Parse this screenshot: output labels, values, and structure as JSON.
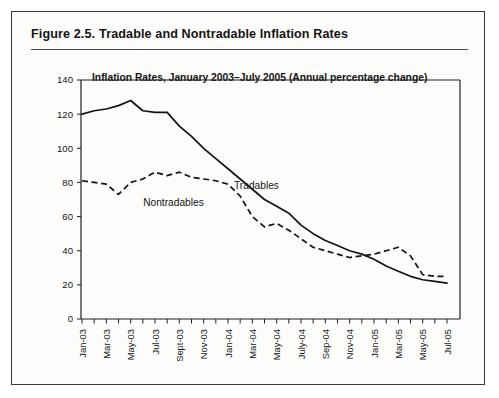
{
  "figure": {
    "number": "Figure 2.5.",
    "caption": "Tradable and Nontradable Inflation Rates"
  },
  "chart_data": {
    "type": "line",
    "title": "Inflation Rates, January 2003–July 2005 (Annual percentage change)",
    "xlabel": "",
    "ylabel": "",
    "ylim": [
      0,
      140
    ],
    "ytick_labels": [
      "0",
      "20",
      "40",
      "60",
      "80",
      "100",
      "120",
      "140"
    ],
    "yticks": [
      0,
      20,
      40,
      60,
      80,
      100,
      120,
      140
    ],
    "grid": false,
    "legend_position": "inline-annotation",
    "x": [
      "Jan-03",
      "Feb-03",
      "Mar-03",
      "Apr-03",
      "May-03",
      "Jun-03",
      "Jul-03",
      "Aug-03",
      "Sept-03",
      "Oct-03",
      "Nov-03",
      "Dec-03",
      "Jan-04",
      "Feb-04",
      "Mar-04",
      "Apr-04",
      "May-04",
      "Jun-04",
      "July-04",
      "Aug-04",
      "Sep-04",
      "Oct-04",
      "Nov-04",
      "Dec-04",
      "Jan-05",
      "Feb-05",
      "Mar-05",
      "Apr-05",
      "May-05",
      "Jun-05",
      "Jul-05"
    ],
    "xtick_labels": [
      "Jan-03",
      "Mar-03",
      "May-03",
      "Jul-03",
      "Sept-03",
      "Nov-03",
      "Jan-04",
      "Mar-04",
      "May-04",
      "July-04",
      "Sep-04",
      "Nov-04",
      "Jan-05",
      "Mar-05",
      "May-05",
      "Jul-05"
    ],
    "xtick_indices": [
      0,
      2,
      4,
      6,
      8,
      10,
      12,
      14,
      16,
      18,
      20,
      22,
      24,
      26,
      28,
      30
    ],
    "series": [
      {
        "name": "Tradables",
        "style": "solid",
        "label_x_index": 12,
        "values": [
          120,
          122,
          123,
          125,
          128,
          122,
          121,
          121,
          113,
          107,
          100,
          94,
          88,
          82,
          76,
          70,
          66,
          62,
          55,
          50,
          46,
          43,
          40,
          38,
          35,
          31,
          28,
          25,
          23,
          22,
          21
        ]
      },
      {
        "name": "Nontradables",
        "style": "dashed",
        "label_x_index": 7,
        "values": [
          81,
          80,
          79,
          73,
          80,
          82,
          86,
          84,
          86,
          83,
          82,
          81,
          79,
          72,
          60,
          54,
          56,
          52,
          47,
          42,
          40,
          38,
          36,
          37,
          38,
          40,
          42,
          37,
          26,
          25,
          25
        ]
      }
    ],
    "annotations": [
      {
        "text": "Tradables",
        "near_series": "Tradables"
      },
      {
        "text": "Nontradables",
        "near_series": "Nontradables"
      }
    ]
  },
  "colors": {
    "line": "#131313",
    "frame": "#3a3a3a",
    "text": "#141414",
    "background": "#ffffff"
  }
}
